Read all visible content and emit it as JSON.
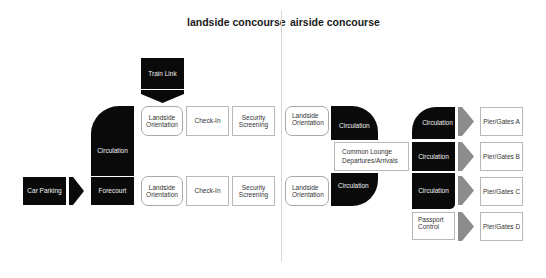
{
  "headers": {
    "landside": "landside concourse",
    "airside": "airside concourse"
  },
  "landside": {
    "train_link": "Train Link",
    "car_parking": "Car Parking",
    "forecourt": "Forecourt",
    "circulation": "Circulation",
    "top_row": {
      "orientation": "Landside\nOrientation",
      "check_in": "Check-In",
      "security": "Security\nScreening"
    },
    "bottom_row": {
      "orientation": "Landside\nOrientation",
      "check_in": "Check-In",
      "security": "Security\nScreening"
    }
  },
  "airside": {
    "top_orientation": "Landside\nOrientation",
    "top_circulation": "Circulation",
    "common_lounge": "Common Lounge\nDepartures/Arrivals",
    "bottom_orientation": "Landside\nOrientation",
    "bottom_circulation": "Circulation",
    "piers": [
      {
        "from": "Circulation",
        "gate": "Pier/Gates A"
      },
      {
        "from": "Circulation",
        "gate": "Pier/Gates B"
      },
      {
        "from": "Circulation",
        "gate": "Pier/Gates C"
      },
      {
        "from": "Passport\nControl",
        "gate": "Pier/Gates D"
      }
    ]
  },
  "colors": {
    "black_block": "#0a0a0a",
    "gray_arrow": "#8c8c8c",
    "box_border": "#b8b8b8",
    "divider": "#d8d8d8"
  }
}
